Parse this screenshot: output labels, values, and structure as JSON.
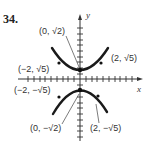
{
  "problem_number": "34.",
  "axes": {
    "x_label": "x",
    "y_label": "y"
  },
  "points": [
    {
      "label": "(0, √2)",
      "x": 0,
      "y": "sqrt2"
    },
    {
      "label": "(2, √5)",
      "x": 2,
      "y": "sqrt5"
    },
    {
      "label": "(−2, √5)",
      "x": -2,
      "y": "sqrt5"
    },
    {
      "label": "(−2, −√5)",
      "x": -2,
      "y": "-sqrt5"
    },
    {
      "label": "(0, −√2)",
      "x": 0,
      "y": "-sqrt2"
    },
    {
      "label": "(2, −√5)",
      "x": 2,
      "y": "-sqrt5"
    }
  ],
  "colors": {
    "ink": "#222222",
    "background": "#ffffff"
  }
}
